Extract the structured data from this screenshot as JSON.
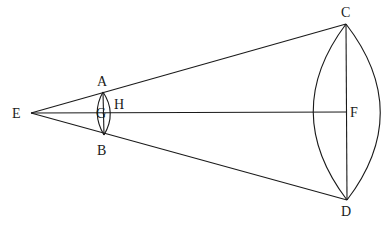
{
  "figure": {
    "type": "geometric-construction",
    "points": {
      "E": {
        "label": "E",
        "x": 31,
        "y": 113
      },
      "A": {
        "label": "A",
        "x": 103,
        "y": 92
      },
      "B": {
        "label": "B",
        "x": 104,
        "y": 135
      },
      "G": {
        "label": "G",
        "x": 100,
        "y": 113
      },
      "H": {
        "label": "H",
        "x": 111,
        "y": 113
      },
      "C": {
        "label": "C",
        "x": 346,
        "y": 24
      },
      "D": {
        "label": "D",
        "x": 347,
        "y": 200
      },
      "F": {
        "label": "F",
        "x": 346,
        "y": 112
      }
    },
    "segments": [
      "EC",
      "ED",
      "EF",
      "AB",
      "CD"
    ],
    "arcs": [
      "AB-left",
      "AB-right",
      "CD-left",
      "CD-right"
    ]
  },
  "labels": {
    "E": "E",
    "A": "A",
    "B": "B",
    "G": "G",
    "H": "H",
    "C": "C",
    "D": "D",
    "F": "F"
  }
}
